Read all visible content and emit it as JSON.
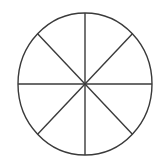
{
  "figure": {
    "name": "fraction-circle",
    "background_color": "#ffffff",
    "stroke_color": "#3a3a3a",
    "fill_color": "#ffffff",
    "stroke_width": 1.4,
    "canvas": {
      "width": 165,
      "height": 166
    },
    "circle": {
      "center_x": 85,
      "center_y": 84,
      "radius_x": 67,
      "radius_y": 71,
      "left_edge_x": 18,
      "right_edge_x": 152,
      "top_edge_y": 13,
      "bottom_edge_y": 155
    },
    "sector_count": 8,
    "sector_fraction_label": "1/8",
    "diameter_count": 4,
    "diameters": [
      {
        "name": "vertical-diameter",
        "angle_degrees": 90,
        "x1": 85,
        "y1": 13,
        "x2": 85,
        "y2": 155
      },
      {
        "name": "horizontal-diameter",
        "angle_degrees": 0,
        "x1": 18,
        "y1": 84,
        "x2": 152,
        "y2": 84
      },
      {
        "name": "diagonal-diameter-nw-se",
        "angle_degrees": 135,
        "x1": 37.6,
        "y1": 33.8,
        "x2": 132.4,
        "y2": 134.2
      },
      {
        "name": "diagonal-diameter-ne-sw",
        "angle_degrees": 45,
        "x1": 132.4,
        "y1": 33.8,
        "x2": 37.6,
        "y2": 134.2
      }
    ],
    "sectors": [
      {
        "name": "sector-1",
        "start_angle": 0,
        "end_angle": 45,
        "fill": "#ffffff"
      },
      {
        "name": "sector-2",
        "start_angle": 45,
        "end_angle": 90,
        "fill": "#ffffff"
      },
      {
        "name": "sector-3",
        "start_angle": 90,
        "end_angle": 135,
        "fill": "#ffffff"
      },
      {
        "name": "sector-4",
        "start_angle": 135,
        "end_angle": 180,
        "fill": "#ffffff"
      },
      {
        "name": "sector-5",
        "start_angle": 180,
        "end_angle": 225,
        "fill": "#ffffff"
      },
      {
        "name": "sector-6",
        "start_angle": 225,
        "end_angle": 270,
        "fill": "#ffffff"
      },
      {
        "name": "sector-7",
        "start_angle": 270,
        "end_angle": 315,
        "fill": "#ffffff"
      },
      {
        "name": "sector-8",
        "start_angle": 315,
        "end_angle": 360,
        "fill": "#ffffff"
      }
    ],
    "labels": []
  }
}
